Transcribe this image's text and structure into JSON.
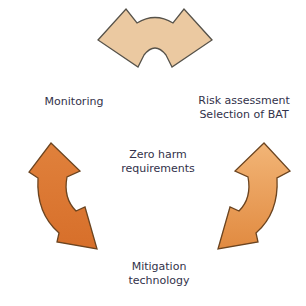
{
  "diagram": {
    "type": "cycle-diagram",
    "labels": {
      "monitoring": "Monitoring",
      "risk_assessment": "Risk assessment\nSelection of BAT",
      "center": "Zero harm\nrequirements",
      "mitigation": "Mitigation\ntechnology"
    },
    "colors": {
      "background": "#ffffff",
      "text": "#32324a",
      "top_arrow_fill": "#ebc9a1",
      "top_arrow_outline": "#56524a",
      "left_arrow_fill_top": "#e0813c",
      "left_arrow_fill_bottom": "#d76f2a",
      "left_arrow_outline": "#6b4420",
      "right_arrow_fill_top": "#f2b577",
      "right_arrow_fill_bottom": "#e18a40",
      "right_arrow_outline": "#6b4420"
    }
  }
}
